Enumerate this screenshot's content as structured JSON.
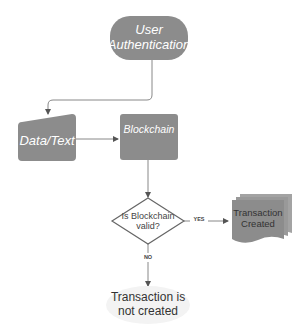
{
  "diagram": {
    "nodes": {
      "start": {
        "label_line1": "User",
        "label_line2": "Authentication",
        "shape": "rounded-terminator"
      },
      "input": {
        "label": "Data/Text",
        "shape": "manual-input"
      },
      "process": {
        "label": "Blockchain",
        "shape": "rounded-rect"
      },
      "decision": {
        "label_line1": "Is Blockchain",
        "label_line2": "valid?",
        "shape": "diamond"
      },
      "yes_result": {
        "label_line1": "Transaction",
        "label_line2": "Created",
        "shape": "multi-document"
      },
      "no_result": {
        "label_line1": "Transaction is",
        "label_line2": "not created",
        "shape": "ellipse-terminator"
      }
    },
    "edges": {
      "yes_label": "YES",
      "no_label": "NO"
    },
    "colors": {
      "node_fill": "#8c8c8c",
      "node_text": "#ffffff",
      "line": "#777777",
      "terminal_fill": "#f2f2f2",
      "dark_text": "#333333"
    }
  }
}
